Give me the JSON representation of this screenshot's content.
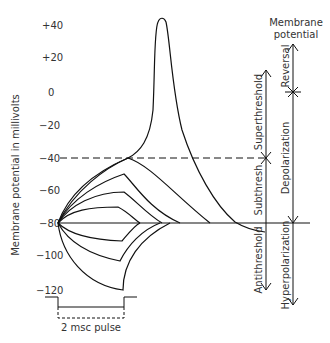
{
  "figure": {
    "y_axis_label": "Membrane potential in millivolts",
    "y_ticks": [
      {
        "label": "+40",
        "y": 25
      },
      {
        "label": "+20",
        "y": 57
      },
      {
        "label": "0",
        "y": 92
      },
      {
        "label": "−20",
        "y": 125
      },
      {
        "label": "−40",
        "y": 158
      },
      {
        "label": "−60",
        "y": 190
      },
      {
        "label": "−80",
        "y": 223
      },
      {
        "label": "−100",
        "y": 255
      },
      {
        "label": "−120",
        "y": 290
      }
    ],
    "pulse_label": "2 msc pulse",
    "right_header_line1": "Membrane",
    "right_header_line2": "potential",
    "threshold_labels": {
      "superthreshold": "Superthreshold",
      "subthreshold": "Subthresh",
      "antithreshold": "Antithreshold"
    },
    "potential_labels": {
      "reversal": "Reversal",
      "depolarization": "Depolarization",
      "hyperpolarization": "Hyperpolarization"
    },
    "reference_lines": {
      "threshold_mV": -40,
      "resting_mV": -80
    },
    "colors": {
      "line": "#111111",
      "text": "#333333",
      "background": "#ffffff"
    }
  }
}
